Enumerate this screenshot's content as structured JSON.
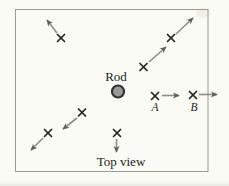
{
  "figure": {
    "labels": {
      "rod": "Rod",
      "top_view": "Top view"
    },
    "border": {
      "x": 15.5,
      "y": 9.5,
      "width": 192.5,
      "height": 162
    },
    "rod": {
      "cx": 118,
      "cy": 91.5,
      "r": 6
    },
    "rod_label_pos": {
      "x": 116,
      "y": 80.5
    },
    "top_view_label_pos": {
      "x": 121,
      "y": 165.5
    },
    "points": [
      {
        "name": "upper-left",
        "cross": [
          61,
          38
        ],
        "arrow": [
          57,
          33,
          47,
          20
        ]
      },
      {
        "name": "upper-right-outer",
        "cross": [
          171,
          38
        ],
        "arrow": [
          176,
          34,
          193,
          18
        ]
      },
      {
        "name": "upper-right-inner",
        "cross": [
          143.5,
          67
        ],
        "arrow": [
          149,
          62,
          166,
          47
        ]
      },
      {
        "name": "point-a",
        "cross": [
          155,
          96
        ],
        "arrow": [
          162,
          95.5,
          179,
          95.5
        ],
        "label": "A",
        "label_pos": [
          155,
          110.5
        ]
      },
      {
        "name": "point-b",
        "cross": [
          193,
          95
        ],
        "arrow": [
          199,
          94.5,
          217,
          94.5
        ],
        "label": "B",
        "label_pos": [
          194,
          110.5
        ]
      },
      {
        "name": "lower-left-inner",
        "cross": [
          82,
          112.5
        ],
        "arrow": [
          77,
          118,
          63,
          129
        ]
      },
      {
        "name": "lower-left-outer",
        "cross": [
          48,
          133
        ],
        "arrow": [
          43,
          138,
          31,
          150
        ]
      },
      {
        "name": "bottom-center",
        "cross": [
          117,
          133
        ],
        "arrow": [
          116.5,
          139,
          116.5,
          152
        ]
      }
    ],
    "cross_half_size": 3.5
  },
  "colors": {
    "paper": "#fbfbf6",
    "border": "#9c9c92",
    "cross": "#26261f",
    "arrow": "#8e8e84",
    "arrowhead": "#5f5f57",
    "rod_fill": "#9a9a94",
    "rod_ring": "#33332e",
    "text": "#1c1c18",
    "smudge": "#ece4d2"
  }
}
